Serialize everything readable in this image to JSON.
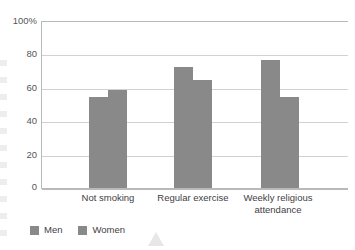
{
  "chart_data": {
    "type": "bar",
    "title": "",
    "subtitle": "",
    "xlabel": "",
    "ylabel": "",
    "categories": [
      "Not smoking",
      "Regular exercise",
      "Weekly religious attendance"
    ],
    "series": [
      {
        "name": "Men",
        "values": [
          55,
          73,
          77
        ],
        "color": "#898989"
      },
      {
        "name": "Women",
        "values": [
          59,
          65,
          55
        ],
        "color": "#898989"
      }
    ],
    "ylim": [
      0,
      100
    ],
    "y_ticks": [
      0,
      20,
      40,
      60,
      80,
      100
    ],
    "y_tick_labels": [
      "0",
      "20",
      "40",
      "60",
      "80",
      "100%"
    ],
    "grid": true,
    "legend_position": "bottom-left",
    "annotations": []
  },
  "axis": {
    "y_tick_labels": [
      "100%",
      "80",
      "60",
      "40",
      "20",
      "0"
    ],
    "x_tick_labels": [
      "Not smoking",
      "Regular exercise",
      "Weekly religious attendance"
    ]
  },
  "legend": {
    "items": [
      {
        "label": "Men",
        "color": "#898989"
      },
      {
        "label": "Women",
        "color": "#898989"
      }
    ]
  },
  "colors": {
    "bar": "#898989",
    "gridline": "#d2d2d2",
    "axis": "#b9b9b9",
    "text": "#3f4044",
    "background": "#ffffff"
  }
}
